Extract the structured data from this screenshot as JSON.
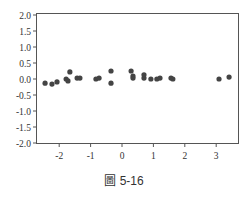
{
  "caption": "圖 5-16",
  "chart_data": {
    "type": "scatter",
    "title": "",
    "xlabel": "",
    "ylabel": "",
    "xlim": [
      -2.75,
      3.7
    ],
    "ylim": [
      -2.0,
      2.0
    ],
    "xticks": [
      -2,
      -1,
      0,
      1,
      2,
      3
    ],
    "xtick_labels": [
      "-2",
      "-1",
      "0",
      "1",
      "2",
      "3"
    ],
    "yticks": [
      2.0,
      1.5,
      1.0,
      0.5,
      0.0,
      -0.5,
      -1.0,
      -1.5,
      -2.0
    ],
    "ytick_labels": [
      "2.0",
      "1.5",
      "1.0",
      "0.5",
      "0.0",
      "-0.5",
      "-1.0",
      "-1.5",
      "-2.0"
    ],
    "grid": false,
    "marker_color": "#444444",
    "points": [
      {
        "x": -2.45,
        "y": -0.13
      },
      {
        "x": -2.23,
        "y": -0.16
      },
      {
        "x": -2.07,
        "y": -0.09
      },
      {
        "x": -1.78,
        "y": 0.0
      },
      {
        "x": -1.72,
        "y": -0.06
      },
      {
        "x": -1.66,
        "y": 0.22
      },
      {
        "x": -1.43,
        "y": 0.03
      },
      {
        "x": -1.34,
        "y": 0.03
      },
      {
        "x": -0.83,
        "y": 0.0
      },
      {
        "x": -0.73,
        "y": 0.03
      },
      {
        "x": -0.35,
        "y": 0.25
      },
      {
        "x": -0.35,
        "y": -0.13
      },
      {
        "x": 0.29,
        "y": 0.25
      },
      {
        "x": 0.35,
        "y": 0.09
      },
      {
        "x": 0.35,
        "y": 0.03
      },
      {
        "x": 0.7,
        "y": 0.03
      },
      {
        "x": 0.7,
        "y": 0.13
      },
      {
        "x": 0.92,
        "y": 0.0
      },
      {
        "x": 1.11,
        "y": 0.0
      },
      {
        "x": 1.21,
        "y": 0.03
      },
      {
        "x": 1.56,
        "y": 0.03
      },
      {
        "x": 1.62,
        "y": 0.0
      },
      {
        "x": 3.09,
        "y": 0.0
      },
      {
        "x": 3.41,
        "y": 0.06
      }
    ]
  }
}
